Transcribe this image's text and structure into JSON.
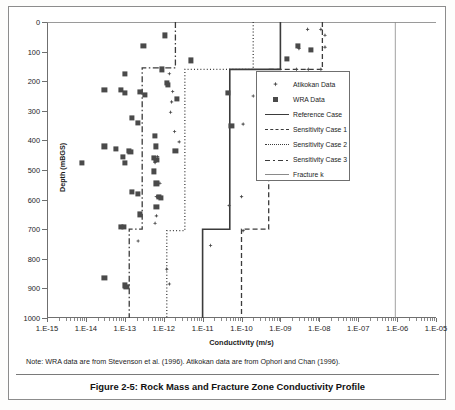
{
  "figure": {
    "caption": "Figure 2-5: Rock Mass and Fracture Zone Conductivity Profile",
    "note": "Note:  WRA data are from Stevenson et al. (1996).  Atikokan data are from Ophori and Chan (1996)."
  },
  "legend": {
    "items": [
      {
        "label": "Atikokan Data",
        "key": "diamond-marker"
      },
      {
        "label": "WRA Data",
        "key": "square-marker"
      },
      {
        "label": "Reference Case",
        "key": "solid-line"
      },
      {
        "label": "Sensitivity Case 1",
        "key": "dashed-line"
      },
      {
        "label": "Sensitivity Case 2",
        "key": "dotted-line"
      },
      {
        "label": "Sensitivity Case 3",
        "key": "dash-dot-line"
      },
      {
        "label": "Fracture k",
        "key": "thin-solid-line"
      }
    ]
  },
  "chart_data": {
    "type": "scatter",
    "title": "Rock Mass and Fracture Zone Conductivity Profile",
    "xlabel": "Conductivity (m/s)",
    "ylabel": "Depth (mBGS)",
    "xscale": "log",
    "xlim": [
      1e-15,
      1e-05
    ],
    "ylim": [
      0,
      1000
    ],
    "y_inverted": true,
    "grid": false,
    "legend_position": "right",
    "xticks": [
      "1.E-15",
      "1.E-14",
      "1.E-13",
      "1.E-12",
      "1.E-11",
      "1.E-10",
      "1.E-09",
      "1.E-08",
      "1.E-07",
      "1.E-06",
      "1.E-05"
    ],
    "xtick_values": [
      1e-15,
      1e-14,
      1e-13,
      1e-12,
      1e-11,
      1e-10,
      1e-09,
      1e-08,
      1e-07,
      1e-06,
      1e-05
    ],
    "yticks": [
      "0",
      "100",
      "200",
      "300",
      "400",
      "500",
      "600",
      "700",
      "800",
      "900",
      "1000"
    ],
    "ytick_values": [
      0,
      100,
      200,
      300,
      400,
      500,
      600,
      700,
      800,
      900,
      1000
    ],
    "series": [
      {
        "name": "Atikokan Data",
        "marker": "diamond",
        "color": "#4a4a4a",
        "points": [
          [
            5e-09,
            25
          ],
          [
            1.1e-08,
            25
          ],
          [
            1.4e-08,
            45
          ],
          [
            1.4e-08,
            85
          ],
          [
            3e-09,
            90
          ],
          [
            2.6e-09,
            160
          ],
          [
            1.1e-08,
            160
          ],
          [
            5.2e-09,
            160
          ],
          [
            3.5e-09,
            195
          ],
          [
            1.4e-12,
            175
          ],
          [
            1.7e-12,
            235
          ],
          [
            1.6e-12,
            270
          ],
          [
            2e-10,
            250
          ],
          [
            1.5e-12,
            305
          ],
          [
            1.1e-10,
            345
          ],
          [
            1.9e-12,
            370
          ],
          [
            2.5e-12,
            405
          ],
          [
            7e-13,
            455
          ],
          [
            6e-13,
            475
          ],
          [
            8e-13,
            545
          ],
          [
            6.5e-13,
            590
          ],
          [
            4.8e-11,
            620
          ],
          [
            1e-10,
            590
          ],
          [
            6.5e-13,
            655
          ],
          [
            6e-13,
            680
          ],
          [
            2.2e-13,
            740
          ],
          [
            1.6e-11,
            755
          ],
          [
            1.1e-10,
            705
          ],
          [
            1.2e-12,
            835
          ],
          [
            1.4e-12,
            885
          ]
        ]
      },
      {
        "name": "WRA Data",
        "marker": "square",
        "color": "#4a4a4a",
        "points": [
          [
            1.1e-12,
            45
          ],
          [
            3e-13,
            80
          ],
          [
            2.8e-09,
            80
          ],
          [
            6e-09,
            95
          ],
          [
            5e-12,
            130
          ],
          [
            1.5e-09,
            125
          ],
          [
            9e-13,
            160
          ],
          [
            1e-13,
            175
          ],
          [
            3e-14,
            230
          ],
          [
            8e-14,
            230
          ],
          [
            1e-13,
            240
          ],
          [
            2.5e-13,
            235
          ],
          [
            3.3e-13,
            245
          ],
          [
            1.2e-12,
            205
          ],
          [
            1.3e-12,
            212
          ],
          [
            2.2e-12,
            260
          ],
          [
            4.5e-11,
            240
          ],
          [
            1.5e-13,
            325
          ],
          [
            2.2e-13,
            340
          ],
          [
            5.5e-11,
            350
          ],
          [
            6e-13,
            385
          ],
          [
            3e-14,
            420
          ],
          [
            6e-14,
            430
          ],
          [
            9e-14,
            455
          ],
          [
            1.3e-13,
            435
          ],
          [
            1.4e-13,
            440
          ],
          [
            6.2e-13,
            420
          ],
          [
            5.5e-13,
            460
          ],
          [
            6.5e-13,
            465
          ],
          [
            2e-12,
            435
          ],
          [
            1e-13,
            475
          ],
          [
            8e-15,
            475
          ],
          [
            5.5e-13,
            505
          ],
          [
            6.5e-13,
            545
          ],
          [
            1.5e-13,
            575
          ],
          [
            2.2e-13,
            580
          ],
          [
            7.5e-13,
            590
          ],
          [
            8.5e-13,
            595
          ],
          [
            6.5e-13,
            625
          ],
          [
            2.5e-13,
            650
          ],
          [
            8e-14,
            692
          ],
          [
            9.5e-14,
            692
          ],
          [
            3e-14,
            865
          ],
          [
            1e-13,
            890
          ],
          [
            1.1e-13,
            895
          ]
        ]
      }
    ],
    "step_curves": [
      {
        "name": "Reference Case",
        "style": "solid",
        "color": "#3b3b3b",
        "width": 1.6,
        "vertices": [
          [
            1e-09,
            0
          ],
          [
            1e-09,
            160
          ],
          [
            5e-11,
            160
          ],
          [
            5e-11,
            700
          ],
          [
            1e-11,
            700
          ],
          [
            1e-11,
            1000
          ]
        ]
      },
      {
        "name": "Sensitivity Case 1",
        "style": "dashed",
        "color": "#3b3b3b",
        "width": 1.3,
        "vertices": [
          [
            1.2e-08,
            0
          ],
          [
            1.2e-08,
            160
          ],
          [
            5e-10,
            160
          ],
          [
            5e-10,
            700
          ],
          [
            1e-10,
            700
          ],
          [
            1e-10,
            1000
          ]
        ]
      },
      {
        "name": "Sensitivity Case 2",
        "style": "dotted",
        "color": "#3b3b3b",
        "width": 1.3,
        "vertices": [
          [
            2e-10,
            0
          ],
          [
            2e-10,
            160
          ],
          [
            3.5e-12,
            160
          ],
          [
            3.5e-12,
            705
          ],
          [
            1.2e-12,
            705
          ],
          [
            1.2e-12,
            1000
          ]
        ]
      },
      {
        "name": "Sensitivity Case 3",
        "style": "dash-dot",
        "color": "#3b3b3b",
        "width": 1.3,
        "vertices": [
          [
            2e-12,
            0
          ],
          [
            2e-12,
            155
          ],
          [
            2.8e-13,
            155
          ],
          [
            2.8e-13,
            700
          ],
          [
            1.3e-13,
            700
          ],
          [
            1.3e-13,
            1000
          ]
        ]
      },
      {
        "name": "Fracture k",
        "style": "thin-solid",
        "color": "#8a8a8a",
        "width": 0.8,
        "vertices": [
          [
            9e-07,
            0
          ],
          [
            9e-07,
            1000
          ]
        ]
      }
    ]
  }
}
